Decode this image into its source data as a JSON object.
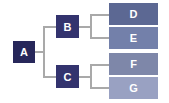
{
  "diagram": {
    "type": "tree",
    "nodes": [
      {
        "id": "A",
        "label": "A",
        "color": "#27275a"
      },
      {
        "id": "B",
        "label": "B",
        "color": "#33336e"
      },
      {
        "id": "C",
        "label": "C",
        "color": "#33336e"
      },
      {
        "id": "D",
        "label": "D",
        "color": "#5c6893"
      },
      {
        "id": "E",
        "label": "E",
        "color": "#7380aa"
      },
      {
        "id": "F",
        "label": "F",
        "color": "#7e87a9"
      },
      {
        "id": "G",
        "label": "G",
        "color": "#99a1c2"
      }
    ],
    "edges": [
      [
        "A",
        "B"
      ],
      [
        "A",
        "C"
      ],
      [
        "B",
        "D"
      ],
      [
        "B",
        "E"
      ],
      [
        "C",
        "F"
      ],
      [
        "C",
        "G"
      ]
    ],
    "connector_color": "#a9a9a9"
  }
}
